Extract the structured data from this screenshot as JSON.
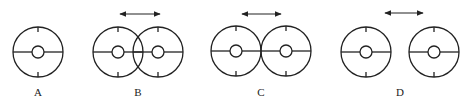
{
  "figures": [
    {
      "label": "A",
      "label_x": 38,
      "circles": [
        {
          "cx": 38,
          "cy": 52
        }
      ],
      "arrow": null
    },
    {
      "label": "B",
      "label_x": 138,
      "circles": [
        {
          "cx": 118,
          "cy": 52
        },
        {
          "cx": 158,
          "cy": 52
        }
      ],
      "arrow": {
        "x1": 120,
        "x2": 160,
        "y": 14
      }
    },
    {
      "label": "C",
      "label_x": 261,
      "circles": [
        {
          "cx": 236,
          "cy": 51
        },
        {
          "cx": 286,
          "cy": 51
        }
      ],
      "arrow": {
        "x1": 242,
        "x2": 281,
        "y": 14
      }
    },
    {
      "label": "D",
      "label_x": 400,
      "circles": [
        {
          "cx": 366,
          "cy": 52
        },
        {
          "cx": 434,
          "cy": 52
        }
      ],
      "arrow": {
        "x1": 385,
        "x2": 423,
        "y": 13
      }
    }
  ],
  "style": {
    "stroke": "#222222",
    "outer_r": 25,
    "inner_r": 6
  }
}
